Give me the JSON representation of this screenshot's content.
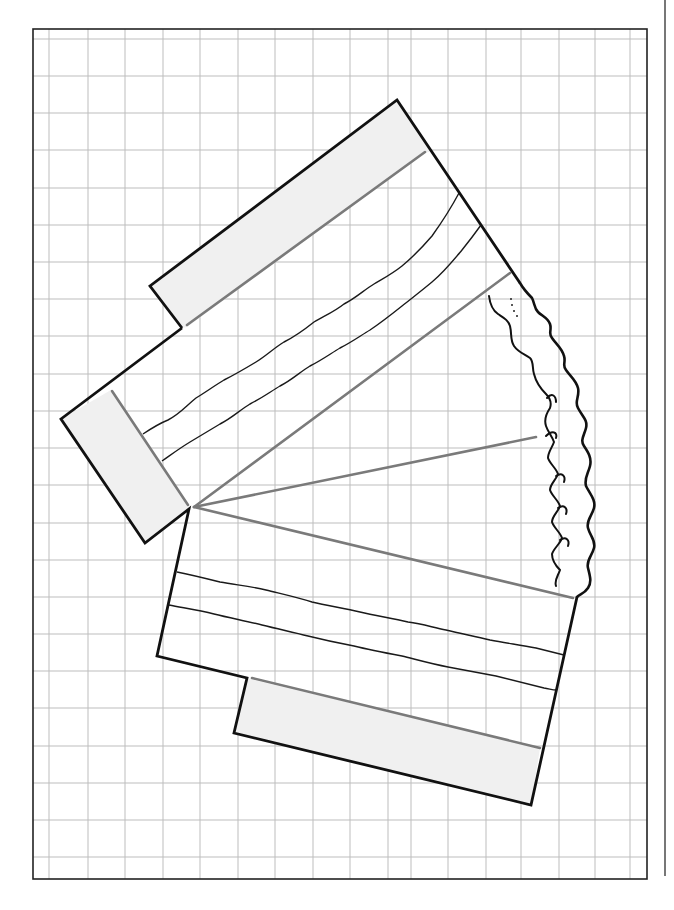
{
  "figure": {
    "background_color": "#ffffff",
    "grid": {
      "line_color": "#bdbdbd",
      "border_color": "#222222",
      "frame": {
        "x1": 33,
        "y1": 29,
        "x2": 647,
        "y2": 879
      },
      "vertical_lines_x": [
        49,
        88,
        125,
        163,
        200,
        238,
        275,
        313,
        350,
        388,
        411,
        448,
        486,
        521,
        559,
        595,
        630
      ],
      "horizontal_lines_y": [
        39,
        76,
        113,
        150,
        188,
        225,
        262,
        299,
        336,
        374,
        411,
        448,
        485,
        523,
        560,
        597,
        634,
        671,
        708,
        746,
        783,
        820,
        857
      ]
    },
    "side_rule": {
      "x": 665,
      "y1": 0,
      "y2": 876,
      "color": "#555555"
    },
    "shape": {
      "outline_color": "#111111",
      "fill_panel_color": "#f0f0f0",
      "fold_line_color": "#7a7a7a",
      "wave_line_color": "#1a1a1a",
      "apex": {
        "x": 193,
        "y": 508
      },
      "upper_panel_label": "upper-strip",
      "left_panel_label": "left-strip",
      "lower_panel_label": "lower-strip",
      "rough_edge_label": "torn-edge"
    }
  }
}
